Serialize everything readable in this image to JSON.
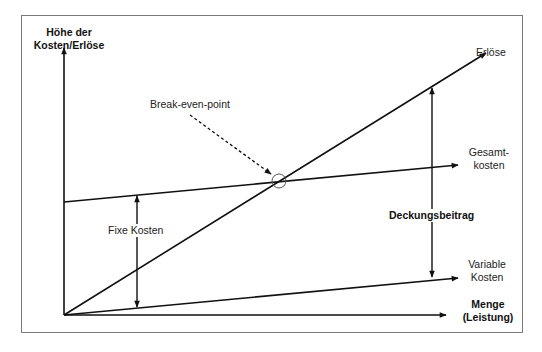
{
  "diagram": {
    "type": "break-even-analysis",
    "y_axis_label": [
      "Höhe der",
      "Kosten/Erlöse"
    ],
    "x_axis_label": [
      "Menge",
      "(Leistung)"
    ],
    "lines": {
      "erloese": "Erlöse",
      "gesamtkosten": [
        "Gesamt-",
        "kosten"
      ],
      "variable_kosten": [
        "Variable",
        "Kosten"
      ]
    },
    "annotations": {
      "break_even": "Break-even-point",
      "fixe_kosten": "Fixe Kosten",
      "deckungsbeitrag": "Deckungsbeitrag"
    },
    "colors": {
      "line": "#111111",
      "frame": "#7a7a7a",
      "circle": "#555555"
    }
  }
}
